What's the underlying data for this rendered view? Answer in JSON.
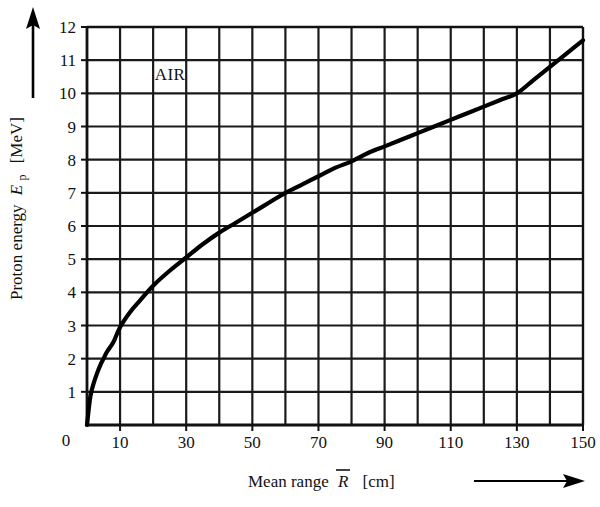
{
  "chart_data": {
    "type": "line",
    "title": "",
    "subtitle": "",
    "annotation": "AIR",
    "xlabel_prefix": "Mean range",
    "xlabel_symbol": "R",
    "xlabel_symbol_overbar": true,
    "xlabel_units": "[cm]",
    "xlabel_full": "Mean range R̅  [cm]",
    "ylabel_prefix": "Proton energy",
    "ylabel_symbol": "E",
    "ylabel_symbol_subscript": "p",
    "ylabel_units": "[MeV]",
    "ylabel_full": "Proton energy Eₚ  [MeV]",
    "xlim": [
      0,
      150
    ],
    "ylim": [
      0,
      12
    ],
    "x_major_step": 20,
    "x_grid_step": 10,
    "y_major_step": 1,
    "y_grid_step": 1,
    "grid": true,
    "legend": "none",
    "x_axis_arrow": true,
    "y_axis_arrow": true,
    "origin_label": "0",
    "xticks": [
      0,
      10,
      30,
      50,
      70,
      90,
      110,
      130,
      150
    ],
    "xtick_labels": [
      "0",
      "10",
      "30",
      "50",
      "70",
      "90",
      "110",
      "130",
      "150"
    ],
    "x_gridlines": [
      0,
      10,
      20,
      30,
      40,
      50,
      60,
      70,
      80,
      90,
      100,
      110,
      120,
      130,
      140,
      150
    ],
    "yticks": [
      0,
      1,
      2,
      3,
      4,
      5,
      6,
      7,
      8,
      9,
      10,
      11,
      12
    ],
    "ytick_labels": [
      "0",
      "1",
      "2",
      "3",
      "4",
      "5",
      "6",
      "7",
      "8",
      "9",
      "10",
      "11",
      "12"
    ],
    "series": [
      {
        "name": "Proton range-energy relation in air",
        "x": [
          0,
          1,
          2,
          3,
          4,
          5,
          6,
          8,
          10,
          13,
          16,
          20,
          25,
          30,
          35,
          40,
          45,
          50,
          55,
          60,
          65,
          70,
          75,
          80,
          85,
          90,
          95,
          100,
          105,
          110,
          115,
          120,
          125,
          130,
          135,
          140,
          145,
          150
        ],
        "y": [
          0.0,
          0.85,
          1.25,
          1.55,
          1.8,
          2.0,
          2.2,
          2.5,
          2.95,
          3.4,
          3.75,
          4.2,
          4.65,
          5.05,
          5.45,
          5.8,
          6.1,
          6.4,
          6.7,
          7.0,
          7.25,
          7.5,
          7.75,
          7.95,
          8.2,
          8.4,
          8.6,
          8.8,
          9.0,
          9.2,
          9.4,
          9.6,
          9.8,
          10.0,
          10.4,
          10.8,
          11.2,
          11.6
        ]
      }
    ],
    "curve_color": "#000000",
    "grid_color": "#1a1a1a",
    "axis_color": "#000000",
    "background_color": "#ffffff"
  },
  "annotations": {
    "material_label": "AIR"
  }
}
